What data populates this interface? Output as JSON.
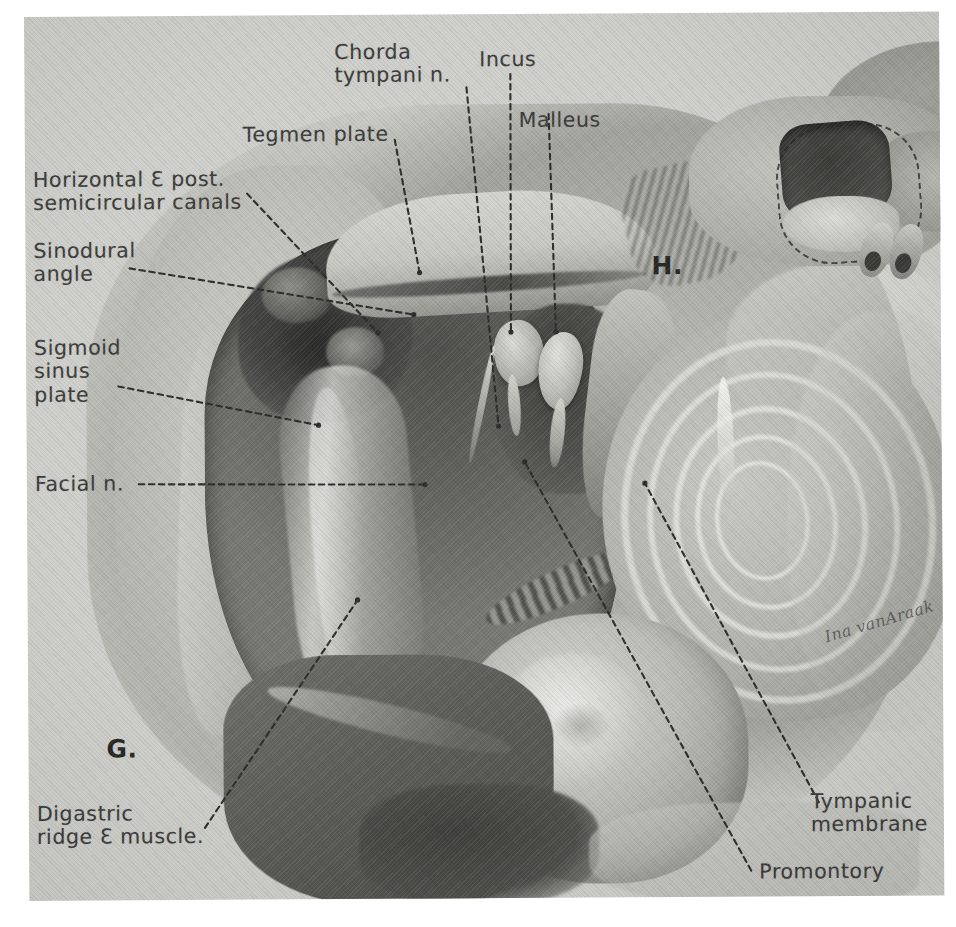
{
  "plate": {
    "figure_letters": {
      "main": "G.",
      "inset": "H."
    },
    "signature": "Ina vanAraak"
  },
  "labels": {
    "chorda_tympani": "Chorda\ntympani n.",
    "incus": "Incus",
    "malleus": "Malleus",
    "tegmen_plate": "Tegmen plate",
    "semicircular_canals": "Horizontal Ɛ post.\nsemicircular canals",
    "sinodural_angle": "Sinodural\nangle",
    "sigmoid_sinus_plate": "Sigmoid\nsinus\nplate",
    "facial_n": "Facial n.",
    "digastric": "Digastric\nridge Ɛ muscle.",
    "tympanic_membrane": "Tympanic\nmembrane",
    "promontory": "Promontory"
  },
  "colors": {
    "paper": "#cfcfcb",
    "ink": "#3b3b3a",
    "leader": "#2b2b2a",
    "cavity_dark": "#4e4e4b",
    "bone_light": "#c9c9c4"
  }
}
